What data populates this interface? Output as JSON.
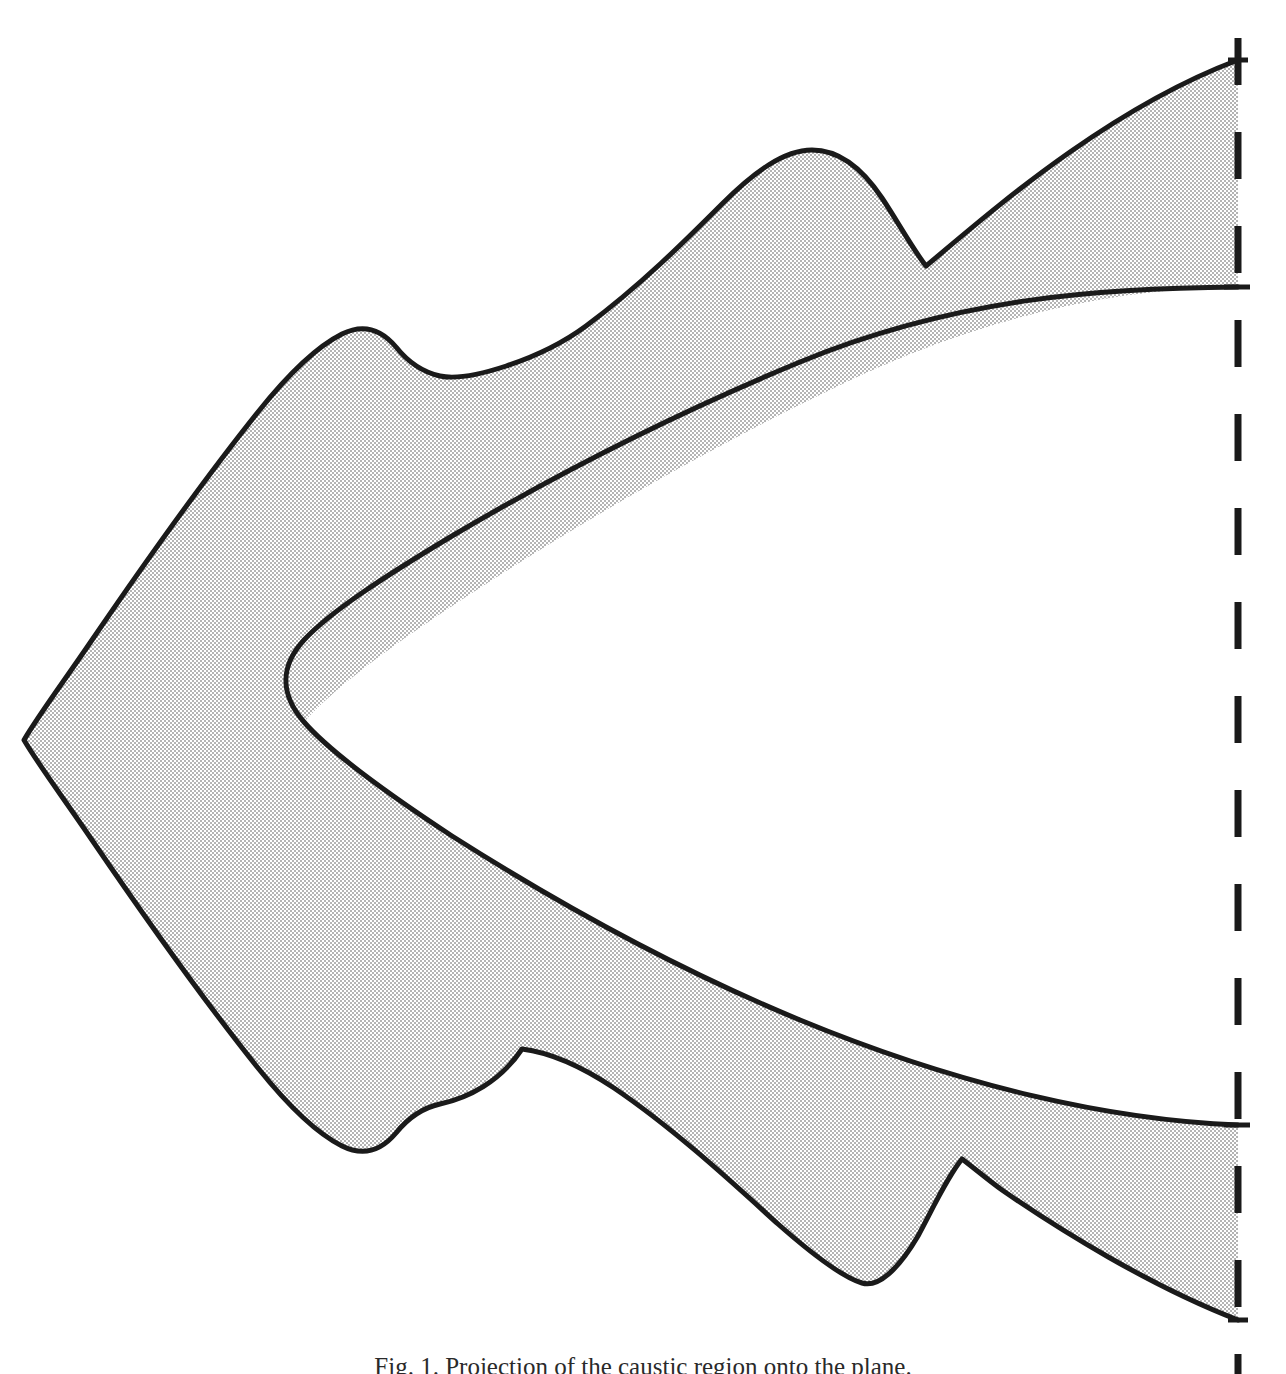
{
  "figure": {
    "caption": "Fig. 1. Projection of the caustic region onto the plane.",
    "background_color": "#ffffff",
    "fill_color": "#d9d9d9",
    "stroke_color": "#1a1a1a",
    "stroke_width": 5,
    "halftone": {
      "enabled": true,
      "dot_color": "#8f8f8f",
      "cell_size": 4
    },
    "canvas": {
      "width": 1286,
      "height": 1374
    }
  },
  "asymptote_line": {
    "label": "dashed vertical asymptote",
    "x": 1238,
    "y_start": 38,
    "y_end": 1374,
    "dash_length": 47,
    "gap_length": 47,
    "color": "#1a1a1a",
    "width": 7
  },
  "chart_data": {
    "type": "area",
    "xlabel": "",
    "ylabel": "",
    "xlim": [
      0,
      1286
    ],
    "ylim": [
      0,
      1374
    ],
    "grid": false,
    "legend": null,
    "annotations": [
      {
        "name": "left-cusp-tip",
        "x": 24,
        "y": 740
      },
      {
        "name": "inner-parabola-vertex",
        "x": 283,
        "y": 726
      },
      {
        "name": "upper-scallop-1-peak",
        "x": 396,
        "y": 347
      },
      {
        "name": "upper-scallop-1-valley",
        "x": 492,
        "y": 400
      },
      {
        "name": "upper-scallop-2-peak",
        "x": 812,
        "y": 150
      },
      {
        "name": "upper-scallop-2-valley",
        "x": 926,
        "y": 266
      },
      {
        "name": "upper-band-top-at-asymptote",
        "x": 1238,
        "y": 60
      },
      {
        "name": "upper-band-bottom-at-asymptote",
        "x": 1238,
        "y": 287
      },
      {
        "name": "lower-band-top-at-asymptote",
        "x": 1238,
        "y": 1125
      },
      {
        "name": "lower-band-bottom-at-asymptote",
        "x": 1238,
        "y": 1320
      },
      {
        "name": "lower-scallop-1-valley",
        "x": 428,
        "y": 1113
      },
      {
        "name": "lower-scallop-1-peak",
        "x": 522,
        "y": 1049
      },
      {
        "name": "lower-scallop-2-valley",
        "x": 862,
        "y": 1283
      },
      {
        "name": "lower-scallop-2-peak",
        "x": 962,
        "y": 1159
      }
    ],
    "outer_boundary_path": "M 1238 60 L 1195 78 C 1090 122 980 205 926 266 C 900 232 868 176 812 150 C 760 126 700 180 640 250 C 560 300 480 352 396 347 C 350 344 310 370 266 430 C 200 520 120 640 24 740 C 100 840 190 960 266 1040 C 320 1096 372 1120 428 1113 C 480 1106 500 1075 522 1049 C 580 1100 640 1180 720 1240 C 790 1292 830 1300 862 1283 C 900 1262 930 1200 962 1159 C 1020 1212 1120 1280 1238 1320",
    "inner_boundary_path": "M 1238 287 C 1100 298 900 360 700 470 C 520 570 370 650 300 700 C 278 716 283 742 300 760 C 370 820 520 920 700 1005 C 900 1100 1100 1118 1238 1125"
  }
}
